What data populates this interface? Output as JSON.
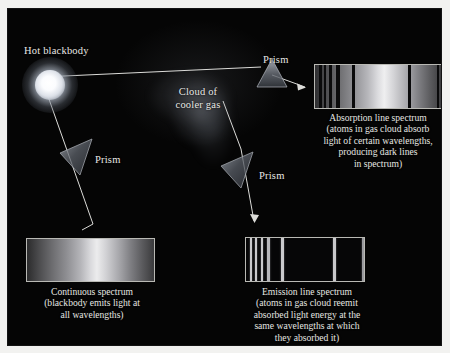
{
  "figure": {
    "background_color": "#050505",
    "page_color": "#f2f2f0",
    "text_color": "#e9e9e6"
  },
  "labels": {
    "hot_blackbody": "Hot blackbody",
    "cloud_of_cooler_gas": "Cloud of\ncooler gas",
    "cloud_line1": "Cloud of",
    "cloud_line2": "cooler gas",
    "prism_left": "Prism",
    "prism_top": "Prism",
    "prism_middle": "Prism"
  },
  "captions": {
    "absorption": "Absorption line spectrum (atoms in gas cloud absorb light of certain wavelengths, producing dark lines in spectrum)",
    "absorption_lines": [
      "Absorption line spectrum",
      "(atoms in gas cloud absorb",
      "light of certain wavelengths,",
      "producing dark lines",
      "in spectrum)"
    ],
    "continuous": "Continuous spectrum (blackbody emits light at all wavelengths)",
    "continuous_lines": [
      "Continuous spectrum",
      "(blackbody emits light at",
      "all wavelengths)"
    ],
    "emission": "Emission line spectrum (atoms in gas cloud reemit absorbed light energy at the same wavelengths at which they absorbed it)",
    "emission_lines": [
      "Emission line spectrum",
      "(atoms in gas cloud reemit",
      "absorbed light energy at the",
      "same wavelengths at which",
      "they absorbed it)"
    ]
  },
  "chart_data": {
    "type": "heatmap",
    "xlabel": "Wavelength",
    "ylabel": "",
    "grid": false,
    "legend_position": "none",
    "panels": [
      {
        "name": "continuous-spectrum",
        "label": "Continuous spectrum",
        "kind": "continuous",
        "note": "blackbody emits light at all wavelengths",
        "box_px": {
          "x": 18,
          "y": 229,
          "w": 129,
          "h": 44
        },
        "gradient_stops_percent": [
          0,
          9,
          20,
          31,
          42,
          50,
          55,
          62,
          72,
          82,
          91,
          100
        ],
        "gradient_colors": [
          "#2b2b2c",
          "#4a4a4c",
          "#6d6d70",
          "#8e8e92",
          "#b4b4b8",
          "#d9d9dc",
          "#ececed",
          "#d2d2d5",
          "#a9a9ad",
          "#7d7d81",
          "#5a5a5d",
          "#3a3a3c"
        ],
        "lines": []
      },
      {
        "name": "absorption-line-spectrum",
        "label": "Absorption line spectrum",
        "kind": "absorption",
        "note": "atoms in gas cloud absorb light of certain wavelengths, producing dark lines in spectrum",
        "box_px": {
          "x": 306,
          "y": 55,
          "w": 128,
          "h": 45
        },
        "gradient_stops_percent": [
          0,
          9,
          20,
          31,
          42,
          50,
          55,
          62,
          72,
          82,
          91,
          100
        ],
        "gradient_colors": [
          "#2e2e30",
          "#4d4d50",
          "#70707 3",
          "#919195",
          "#b7b7bb",
          "#dcdcdf",
          "#efeff0",
          "#d5d5d8",
          "#acacb0",
          "#808084",
          "#5d5d60",
          "#3d3d3f"
        ],
        "lines": [
          {
            "position_percent": 3.5,
            "width_percent": 2.0,
            "color": "#0a0a0b"
          },
          {
            "position_percent": 7.5,
            "width_percent": 1.6,
            "color": "#0a0a0b"
          },
          {
            "position_percent": 11.5,
            "width_percent": 1.6,
            "color": "#0a0a0b"
          },
          {
            "position_percent": 16.5,
            "width_percent": 3.2,
            "color": "#0a0a0b"
          },
          {
            "position_percent": 29.5,
            "width_percent": 2.4,
            "color": "#0a0a0b"
          },
          {
            "position_percent": 74.0,
            "width_percent": 2.4,
            "color": "#0a0a0b"
          },
          {
            "position_percent": 96.5,
            "width_percent": 2.0,
            "color": "#0a0a0b"
          }
        ]
      },
      {
        "name": "emission-line-spectrum",
        "label": "Emission line spectrum",
        "kind": "emission",
        "note": "atoms in gas cloud reemit absorbed light energy at the same wavelengths at which they absorbed it",
        "box_px": {
          "x": 237,
          "y": 228,
          "w": 120,
          "h": 45
        },
        "background_color": "#060607",
        "lines": [
          {
            "position_percent": 3.5,
            "width_percent": 1.8,
            "color": "#c9c9cc"
          },
          {
            "position_percent": 8.0,
            "width_percent": 1.6,
            "color": "#c9c9cc"
          },
          {
            "position_percent": 12.5,
            "width_percent": 1.6,
            "color": "#c9c9cc"
          },
          {
            "position_percent": 17.5,
            "width_percent": 3.0,
            "color": "#b6b6ba"
          },
          {
            "position_percent": 30.0,
            "width_percent": 2.2,
            "color": "#c9c9cc"
          },
          {
            "position_percent": 74.0,
            "width_percent": 2.0,
            "color": "#c9c9cc"
          },
          {
            "position_percent": 98.0,
            "width_percent": 1.6,
            "color": "#9a9a9e"
          }
        ]
      }
    ],
    "objects": [
      {
        "name": "hot-blackbody",
        "label": "Hot blackbody",
        "center_px": [
          42,
          76
        ],
        "kind": "star"
      },
      {
        "name": "cloud-of-cooler-gas",
        "label": "Cloud of cooler gas",
        "center_px": [
          190,
          104
        ],
        "kind": "gas-cloud"
      },
      {
        "name": "prism-left",
        "label": "Prism",
        "center_px": [
          72,
          152
        ],
        "kind": "prism"
      },
      {
        "name": "prism-top",
        "label": "Prism",
        "center_px": [
          268,
          66
        ],
        "kind": "prism"
      },
      {
        "name": "prism-middle",
        "label": "Prism",
        "center_px": [
          233,
          163
        ],
        "kind": "prism"
      }
    ]
  }
}
